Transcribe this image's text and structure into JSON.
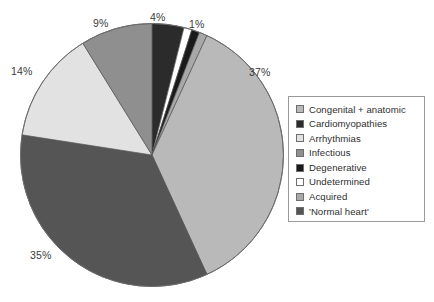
{
  "chart_data": {
    "type": "pie",
    "title": "",
    "subtitle": "",
    "xlabel": "",
    "ylabel": "",
    "grid": false,
    "legend_position": "right",
    "units": "percent",
    "start_angle_deg": 0,
    "direction": "clockwise",
    "categories": [
      "Congenital + anatomic",
      "Cardiomyopathies",
      "Arrhythmias",
      "Infectious",
      "Degenerative",
      "Undetermined",
      "Acquired",
      "'Normal heart'"
    ],
    "values": [
      37,
      4,
      14,
      9,
      1,
      1,
      1,
      35
    ],
    "colors": [
      "#b9b9b9",
      "#2b2b2b",
      "#e2e2e2",
      "#8f8f8f",
      "#1a1a1a",
      "#ffffff",
      "#a8a8a8",
      "#555555"
    ],
    "slice_order_clockwise_from_top": [
      {
        "label": "Cardiomyopathies",
        "value": 4,
        "color": "#2b2b2b",
        "shown_label": "4%"
      },
      {
        "label": "Undetermined",
        "value": 1,
        "color": "#ffffff",
        "shown_label": ""
      },
      {
        "label": "Degenerative",
        "value": 1,
        "color": "#1a1a1a",
        "shown_label": ""
      },
      {
        "label": "Acquired",
        "value": 1,
        "color": "#a8a8a8",
        "shown_label": "1%"
      },
      {
        "label": "Congenital + anatomic",
        "value": 37,
        "color": "#b9b9b9",
        "shown_label": "37%"
      },
      {
        "label": "'Normal heart'",
        "value": 35,
        "color": "#555555",
        "shown_label": "35%"
      },
      {
        "label": "Arrhythmias",
        "value": 14,
        "color": "#e2e2e2",
        "shown_label": "14%"
      },
      {
        "label": "Infectious",
        "value": 9,
        "color": "#8f8f8f",
        "shown_label": "9%"
      }
    ],
    "data_labels": [
      "4%",
      "1%",
      "37%",
      "35%",
      "14%",
      "9%"
    ]
  },
  "labels": {
    "pct_4": "4%",
    "pct_1": "1%",
    "pct_37": "37%",
    "pct_35": "35%",
    "pct_14": "14%",
    "pct_9": "9%"
  },
  "legend": {
    "items": [
      {
        "label": "Congenital + anatomic",
        "color": "#b9b9b9"
      },
      {
        "label": "Cardiomyopathies",
        "color": "#2b2b2b"
      },
      {
        "label": "Arrhythmias",
        "color": "#e2e2e2"
      },
      {
        "label": "Infectious",
        "color": "#8f8f8f"
      },
      {
        "label": "Degenerative",
        "color": "#1a1a1a"
      },
      {
        "label": "Undetermined",
        "color": "#ffffff"
      },
      {
        "label": "Acquired",
        "color": "#a8a8a8"
      },
      {
        "label": "'Normal heart'",
        "color": "#555555"
      }
    ]
  }
}
